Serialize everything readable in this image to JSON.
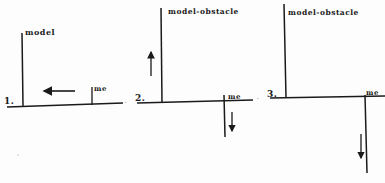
{
  "diagram": {
    "panels": [
      {
        "number": "1.",
        "model_label": "model",
        "me_label": "me",
        "model_motion": "left",
        "me_motion": "none"
      },
      {
        "number": "2.",
        "model_label": "model-obstacle",
        "me_label": "me",
        "model_motion": "up",
        "me_motion": "down"
      },
      {
        "number": "3.",
        "model_label": "model-obstacle",
        "me_label": "me",
        "model_motion": "none",
        "me_motion": "down"
      }
    ],
    "colors": {
      "ink": "#1a1a1a",
      "background": "#fdfdfd"
    }
  }
}
